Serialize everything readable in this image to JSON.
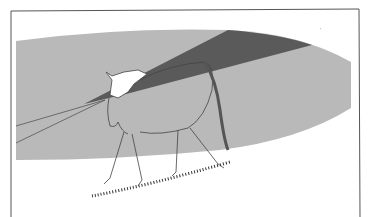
{
  "figure": {
    "colors": {
      "background": "#ffffff",
      "frame": "#555555",
      "visual_field": "#b9b9b9",
      "blind_spot": "#5a5a5a",
      "outline": "#444444"
    },
    "corner_mark": "'"
  }
}
